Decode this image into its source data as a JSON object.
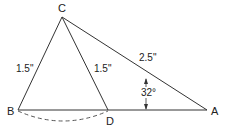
{
  "diagram": {
    "points": {
      "C": {
        "label": "C",
        "x": 62,
        "y": 17
      },
      "B": {
        "label": "B",
        "x": 18,
        "y": 110
      },
      "D": {
        "label": "D",
        "x": 108,
        "y": 110
      },
      "A": {
        "label": "A",
        "x": 207,
        "y": 110
      }
    },
    "measures": {
      "CB": "1.5\"",
      "CD": "1.5\"",
      "CA": "2.5\"",
      "angle_A": "32°"
    },
    "colors": {
      "stroke": "#333333",
      "text": "#222222"
    }
  }
}
